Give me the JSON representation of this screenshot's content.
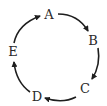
{
  "diagram": {
    "type": "cycle",
    "direction": "clockwise",
    "nodes": [
      {
        "id": "A",
        "label": "A",
        "x": 49,
        "y": 19
      },
      {
        "id": "B",
        "label": "B",
        "x": 93,
        "y": 45
      },
      {
        "id": "C",
        "label": "C",
        "x": 85,
        "y": 93
      },
      {
        "id": "D",
        "label": "D",
        "x": 37,
        "y": 101
      },
      {
        "id": "E",
        "label": "E",
        "x": 13,
        "y": 56
      }
    ],
    "edges": [
      {
        "from": "A",
        "to": "B"
      },
      {
        "from": "B",
        "to": "C"
      },
      {
        "from": "C",
        "to": "D"
      },
      {
        "from": "D",
        "to": "E"
      },
      {
        "from": "E",
        "to": "A"
      }
    ],
    "colors": {
      "stroke": "#1e1e1e",
      "text": "#2a2a2a",
      "background": "#ffffff"
    }
  }
}
